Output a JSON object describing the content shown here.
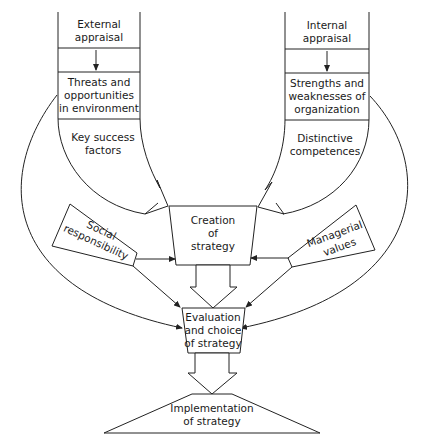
{
  "diagram": {
    "type": "strategy-formulation-flow",
    "colors": {
      "line": "#222222",
      "text": "#1a1a1a",
      "background": "#ffffff"
    },
    "left_column": {
      "top": "External appraisal",
      "top_lines": [
        "External",
        "appraisal"
      ],
      "middle_lines": [
        "Threats and",
        "opportunities",
        "in environment"
      ],
      "bottom_lines": [
        "Key success",
        "factors"
      ]
    },
    "right_column": {
      "top": "Internal appraisal",
      "top_lines": [
        "Internal",
        "appraisal"
      ],
      "middle_lines": [
        "Strengths and",
        "weaknesses of",
        "organization"
      ],
      "bottom_lines": [
        "Distinctive",
        "competences"
      ]
    },
    "creation": {
      "lines": [
        "Creation",
        "of",
        "strategy"
      ]
    },
    "social": {
      "lines": [
        "Social",
        "responsibility"
      ]
    },
    "managerial": {
      "lines": [
        "Managerial",
        "values"
      ]
    },
    "evaluation": {
      "lines": [
        "Evaluation",
        "and choice",
        "of strategy"
      ]
    },
    "implementation": {
      "lines": [
        "Implementation",
        "of strategy"
      ]
    }
  }
}
